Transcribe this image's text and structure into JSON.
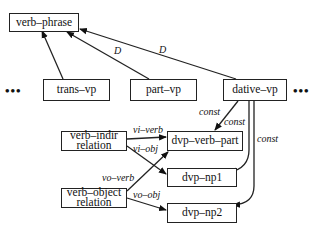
{
  "nodes": {
    "verb_phrase": "verb–phrase",
    "trans_vp": "trans–vp",
    "part_vp": "part–vp",
    "dative_vp": "dative–vp",
    "verb_indir_line1": "verb–indir",
    "verb_indir_line2": "relation",
    "dvp_verb_part": "dvp–verb–part",
    "dvp_np1": "dvp–np1",
    "verb_object_line1": "verb–object",
    "verb_object_line2": "relation",
    "dvp_np2": "dvp–np2"
  },
  "edge_labels": {
    "part_d": "D",
    "dative_d": "D",
    "const_1": "const",
    "const_2": "const",
    "const_3": "const",
    "vi_verb": "vi–verb",
    "vi_obj": "vi–obj",
    "vo_verb": "vo–verb",
    "vo_obj": "vo–obj"
  },
  "ellipsis": {
    "left": "•••",
    "right": "•••"
  }
}
